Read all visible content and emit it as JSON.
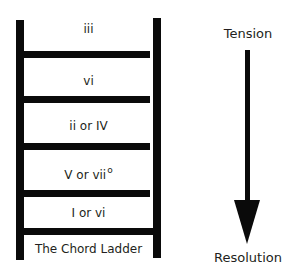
{
  "diagram": {
    "title": "The Chord Ladder",
    "rungs": [
      {
        "label": "iii",
        "superscript": ""
      },
      {
        "label": "vi",
        "superscript": ""
      },
      {
        "label": "ii or IV",
        "superscript": ""
      },
      {
        "label": "V or vii",
        "superscript": "o"
      },
      {
        "label": "I or vi",
        "superscript": ""
      }
    ],
    "arrow": {
      "top_label": "Tension",
      "bottom_label": "Resolution",
      "direction": "down"
    },
    "colors": {
      "ladder": "#0a0a0a",
      "text": "#231f20",
      "background": "#ffffff"
    }
  }
}
